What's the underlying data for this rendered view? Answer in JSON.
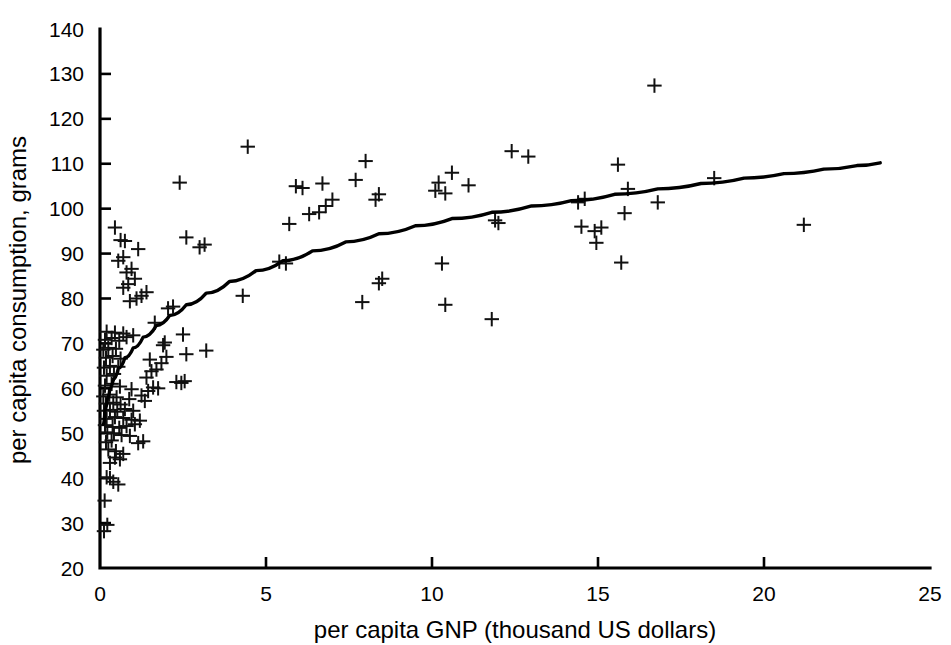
{
  "chart_data": {
    "type": "scatter",
    "title": "",
    "xlabel": "per capita GNP (thousand US dollars)",
    "ylabel": "per capita consumption, grams",
    "xlim": [
      0,
      25
    ],
    "ylim": [
      20,
      140
    ],
    "xticks": [
      0,
      5,
      10,
      15,
      20,
      25
    ],
    "yticks": [
      20,
      30,
      40,
      50,
      60,
      70,
      80,
      90,
      100,
      110,
      120,
      130,
      140
    ],
    "grid": false,
    "legend": null,
    "marker": "plus",
    "series": [
      {
        "name": "countries",
        "marker": "plus",
        "points": [
          [
            0.12,
            28.2
          ],
          [
            0.22,
            29.6
          ],
          [
            0.14,
            35.0
          ],
          [
            0.2,
            40.2
          ],
          [
            0.3,
            40.0
          ],
          [
            0.4,
            39.2
          ],
          [
            0.55,
            38.6
          ],
          [
            0.3,
            43.4
          ],
          [
            0.45,
            44.6
          ],
          [
            0.6,
            44.2
          ],
          [
            0.25,
            46.4
          ],
          [
            0.48,
            46.0
          ],
          [
            0.7,
            45.4
          ],
          [
            0.18,
            48.0
          ],
          [
            0.35,
            48.4
          ],
          [
            1.15,
            47.8
          ],
          [
            1.3,
            48.2
          ],
          [
            0.22,
            50.2
          ],
          [
            0.42,
            50.0
          ],
          [
            0.65,
            49.6
          ],
          [
            0.9,
            49.4
          ],
          [
            0.15,
            51.8
          ],
          [
            0.38,
            51.4
          ],
          [
            0.58,
            51.2
          ],
          [
            0.8,
            51.6
          ],
          [
            1.05,
            52.0
          ],
          [
            0.2,
            53.2
          ],
          [
            0.45,
            53.6
          ],
          [
            0.7,
            53.4
          ],
          [
            0.95,
            53.0
          ],
          [
            1.2,
            52.8
          ],
          [
            0.12,
            55.0
          ],
          [
            0.3,
            55.2
          ],
          [
            0.52,
            54.8
          ],
          [
            0.75,
            55.4
          ],
          [
            1.0,
            55.0
          ],
          [
            0.18,
            56.6
          ],
          [
            0.4,
            56.8
          ],
          [
            0.62,
            56.4
          ],
          [
            0.1,
            58.2
          ],
          [
            0.28,
            58.6
          ],
          [
            0.5,
            58.0
          ],
          [
            0.88,
            57.6
          ],
          [
            1.35,
            57.2
          ],
          [
            1.6,
            60.2
          ],
          [
            1.75,
            60.0
          ],
          [
            0.15,
            60.6
          ],
          [
            0.35,
            61.0
          ],
          [
            0.6,
            60.4
          ],
          [
            0.95,
            59.8
          ],
          [
            1.45,
            59.4
          ],
          [
            1.25,
            58.4
          ],
          [
            2.3,
            61.4
          ],
          [
            2.45,
            61.2
          ],
          [
            2.55,
            61.6
          ],
          [
            0.2,
            62.8
          ],
          [
            0.42,
            63.2
          ],
          [
            1.4,
            62.4
          ],
          [
            1.55,
            63.8
          ],
          [
            0.12,
            64.6
          ],
          [
            0.3,
            65.0
          ],
          [
            0.55,
            64.8
          ],
          [
            1.7,
            64.2
          ],
          [
            1.85,
            65.6
          ],
          [
            0.18,
            66.8
          ],
          [
            0.38,
            67.2
          ],
          [
            0.62,
            66.6
          ],
          [
            1.5,
            66.4
          ],
          [
            2.0,
            67.0
          ],
          [
            2.6,
            67.6
          ],
          [
            3.2,
            68.4
          ],
          [
            0.1,
            68.6
          ],
          [
            0.25,
            69.0
          ],
          [
            0.48,
            68.8
          ],
          [
            1.9,
            69.6
          ],
          [
            0.15,
            70.8
          ],
          [
            0.35,
            71.2
          ],
          [
            0.58,
            70.6
          ],
          [
            0.8,
            71.4
          ],
          [
            1.95,
            70.2
          ],
          [
            2.5,
            72.0
          ],
          [
            0.2,
            72.6
          ],
          [
            0.45,
            72.4
          ],
          [
            0.7,
            72.2
          ],
          [
            1.0,
            71.8
          ],
          [
            1.65,
            74.6
          ],
          [
            2.05,
            77.8
          ],
          [
            2.2,
            78.2
          ],
          [
            0.9,
            79.4
          ],
          [
            1.1,
            80.0
          ],
          [
            1.25,
            80.6
          ],
          [
            1.4,
            81.4
          ],
          [
            4.3,
            80.6
          ],
          [
            0.7,
            82.4
          ],
          [
            0.85,
            83.2
          ],
          [
            1.05,
            84.4
          ],
          [
            0.8,
            85.8
          ],
          [
            0.95,
            86.6
          ],
          [
            5.4,
            88.2
          ],
          [
            5.6,
            87.8
          ],
          [
            7.9,
            79.2
          ],
          [
            8.4,
            83.4
          ],
          [
            8.5,
            84.4
          ],
          [
            10.4,
            78.6
          ],
          [
            11.8,
            75.4
          ],
          [
            11.9,
            97.4
          ],
          [
            12.0,
            96.8
          ],
          [
            0.55,
            88.4
          ],
          [
            0.7,
            89.2
          ],
          [
            1.15,
            91.0
          ],
          [
            3.0,
            91.4
          ],
          [
            3.15,
            92.0
          ],
          [
            2.6,
            93.6
          ],
          [
            0.45,
            95.8
          ],
          [
            0.62,
            93.0
          ],
          [
            0.75,
            92.8
          ],
          [
            5.7,
            96.6
          ],
          [
            6.3,
            98.8
          ],
          [
            6.6,
            99.2
          ],
          [
            6.8,
            100.6
          ],
          [
            7.0,
            102.0
          ],
          [
            5.9,
            105.0
          ],
          [
            6.1,
            104.6
          ],
          [
            6.7,
            105.6
          ],
          [
            7.7,
            106.4
          ],
          [
            8.3,
            102.0
          ],
          [
            8.4,
            103.2
          ],
          [
            2.4,
            105.8
          ],
          [
            4.45,
            113.8
          ],
          [
            8.0,
            110.6
          ],
          [
            10.1,
            104.0
          ],
          [
            10.2,
            105.8
          ],
          [
            10.4,
            103.4
          ],
          [
            10.6,
            108.0
          ],
          [
            11.1,
            105.2
          ],
          [
            10.3,
            87.8
          ],
          [
            12.4,
            112.8
          ],
          [
            12.9,
            111.6
          ],
          [
            14.4,
            101.4
          ],
          [
            14.6,
            102.2
          ],
          [
            14.5,
            96.0
          ],
          [
            14.9,
            95.0
          ],
          [
            15.1,
            95.8
          ],
          [
            14.95,
            92.4
          ],
          [
            15.8,
            99.0
          ],
          [
            15.6,
            109.8
          ],
          [
            15.9,
            104.4
          ],
          [
            15.7,
            88.0
          ],
          [
            16.7,
            127.4
          ],
          [
            16.8,
            101.4
          ],
          [
            18.5,
            106.8
          ],
          [
            21.2,
            96.4
          ]
        ]
      }
    ],
    "fit_curve": {
      "name": "logarithmic fit",
      "points": [
        [
          0.1,
          52.0
        ],
        [
          0.15,
          55.0
        ],
        [
          0.22,
          57.6
        ],
        [
          0.3,
          60.0
        ],
        [
          0.4,
          62.0
        ],
        [
          0.55,
          64.4
        ],
        [
          0.75,
          66.8
        ],
        [
          1.0,
          69.0
        ],
        [
          1.3,
          71.4
        ],
        [
          1.7,
          74.0
        ],
        [
          2.1,
          76.2
        ],
        [
          2.6,
          78.6
        ],
        [
          3.2,
          81.2
        ],
        [
          3.9,
          83.8
        ],
        [
          4.7,
          86.2
        ],
        [
          5.5,
          88.4
        ],
        [
          6.4,
          90.6
        ],
        [
          7.4,
          92.6
        ],
        [
          8.4,
          94.4
        ],
        [
          9.5,
          96.2
        ],
        [
          10.6,
          97.8
        ],
        [
          11.8,
          99.2
        ],
        [
          13.0,
          100.6
        ],
        [
          14.2,
          101.8
        ],
        [
          15.5,
          103.2
        ],
        [
          16.8,
          104.4
        ],
        [
          18.1,
          105.6
        ],
        [
          19.4,
          106.8
        ],
        [
          20.6,
          107.8
        ],
        [
          21.8,
          108.8
        ],
        [
          22.8,
          109.6
        ],
        [
          23.5,
          110.2
        ]
      ]
    }
  }
}
